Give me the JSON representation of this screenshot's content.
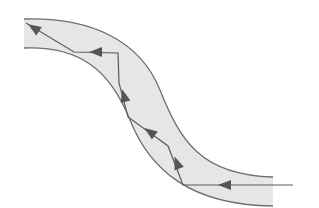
{
  "diagram": {
    "type": "optical-fiber-total-internal-reflection",
    "colors": {
      "background": "#ffffff",
      "fiber_fill": "#e6e6e6",
      "fiber_edge": "#6e6e6e",
      "ray": "#5a5a5a",
      "arrow": "#555555"
    },
    "fiber": {
      "top_edge": "M24,19 C90,17 140,40 160,90 C180,140 200,175 273,177",
      "bottom_edge": "M24,48 C80,46 110,70 130,120 C150,170 190,205 273,206",
      "fill": "M24,19 C90,17 140,40 160,90 C180,140 200,175 273,177 L273,206 C190,205 150,170 130,120 C110,70 80,46 24,48 Z"
    },
    "ray_points": "293,185 183,185 168,146 128,117 119,83 118,53 74,52 26,23",
    "arrows": [
      {
        "name": "arrow-entry",
        "x": 225,
        "y": 185,
        "angle": 180
      },
      {
        "name": "arrow-2",
        "x": 177,
        "y": 163,
        "angle": -111
      },
      {
        "name": "arrow-3",
        "x": 150,
        "y": 132,
        "angle": -144
      },
      {
        "name": "arrow-4",
        "x": 124,
        "y": 96,
        "angle": -105
      },
      {
        "name": "arrow-5",
        "x": 96,
        "y": 52,
        "angle": 180
      },
      {
        "name": "arrow-exit",
        "x": 34,
        "y": 28,
        "angle": -147
      }
    ]
  }
}
